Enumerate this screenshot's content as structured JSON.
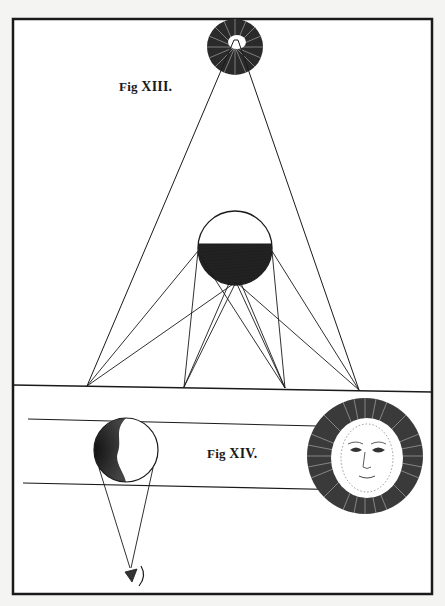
{
  "figure_labels": {
    "fig13": {
      "prefix": "Fig",
      "numeral": "XIII."
    },
    "fig14": {
      "prefix": "Fig",
      "numeral": "XIV."
    }
  },
  "colors": {
    "paper": "#ffffff",
    "background": "#f4f4f2",
    "ink": "#1a1a1a"
  },
  "diagram": {
    "frame": {
      "x": 13,
      "y": 19,
      "width": 419,
      "height": 575
    },
    "fig13": {
      "light_source": {
        "cx": 235,
        "cy": 47,
        "r": 28
      },
      "sphere": {
        "cx": 235,
        "cy": 248,
        "r": 37,
        "shadow_from_y": 244
      },
      "ground_y_left": 386,
      "ground_y_right": 392,
      "base_points": [
        [
          87,
          386
        ],
        [
          184,
          387
        ],
        [
          285,
          388
        ],
        [
          359,
          390
        ]
      ]
    },
    "fig14": {
      "upper_ray": {
        "x1": 28,
        "y1": 419,
        "x2": 360,
        "y2": 427
      },
      "lower_ray": {
        "x1": 23,
        "y1": 483,
        "x2": 355,
        "y2": 490
      },
      "moon": {
        "cx": 126,
        "cy": 450,
        "r": 32
      },
      "eye": {
        "x": 130,
        "y": 575
      },
      "sun": {
        "cx": 365,
        "cy": 456,
        "r": 58,
        "face_r": 36
      }
    }
  }
}
